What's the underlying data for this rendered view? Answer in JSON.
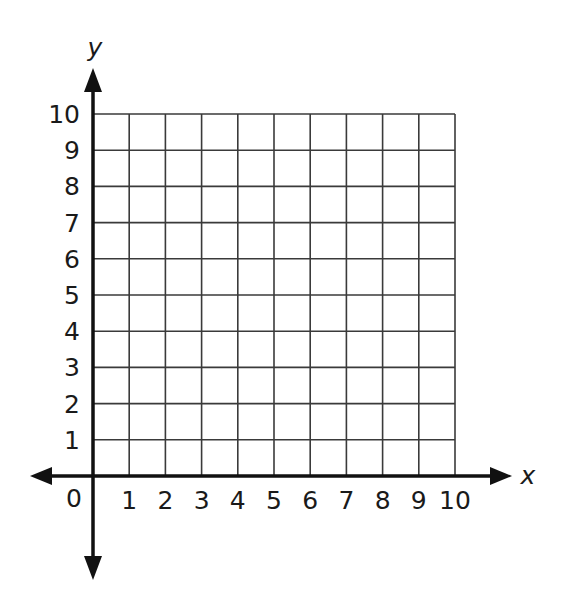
{
  "chart_data": {
    "type": "scatter",
    "title": "",
    "xlabel": "x",
    "ylabel": "y",
    "xlim": [
      0,
      10
    ],
    "ylim": [
      0,
      10
    ],
    "grid": true,
    "x_ticks": [
      "1",
      "2",
      "3",
      "4",
      "5",
      "6",
      "7",
      "8",
      "9",
      "10"
    ],
    "y_ticks": [
      "1",
      "2",
      "3",
      "4",
      "5",
      "6",
      "7",
      "8",
      "9",
      "10"
    ],
    "origin_label": "0",
    "series": [],
    "legend": null
  },
  "colors": {
    "grid": "#3a3a3a",
    "axis": "#111111",
    "background": "#ffffff"
  }
}
